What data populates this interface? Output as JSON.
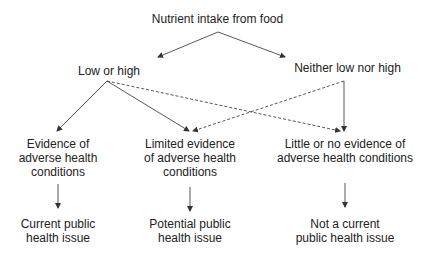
{
  "root": {
    "label": "Nutrient intake from food"
  },
  "level1": [
    {
      "label": "Low or high"
    },
    {
      "label": "Neither low nor high"
    }
  ],
  "level2": [
    {
      "lines": [
        "Evidence of",
        "adverse health",
        "conditions"
      ]
    },
    {
      "lines": [
        "Limited evidence",
        "of adverse health",
        "conditions"
      ]
    },
    {
      "lines": [
        "Little or no evidence of",
        "adverse health conditions"
      ]
    }
  ],
  "level3": [
    {
      "lines": [
        "Current public",
        "health issue"
      ]
    },
    {
      "lines": [
        "Potential public",
        "health issue"
      ]
    },
    {
      "lines": [
        "Not a current",
        "public health issue"
      ]
    }
  ],
  "edges": {
    "solid": [
      {
        "from": "Nutrient intake from food",
        "to": "Low or high"
      },
      {
        "from": "Nutrient intake from food",
        "to": "Neither low nor high"
      },
      {
        "from": "Low or high",
        "to": "Evidence of adverse health conditions"
      },
      {
        "from": "Low or high",
        "to": "Limited evidence of adverse health conditions"
      },
      {
        "from": "Neither low nor high",
        "to": "Little or no evidence of adverse health conditions"
      },
      {
        "from": "Evidence of adverse health conditions",
        "to": "Current public health issue"
      },
      {
        "from": "Limited evidence of adverse health conditions",
        "to": "Potential public health issue"
      },
      {
        "from": "Little or no evidence of adverse health conditions",
        "to": "Not a current public health issue"
      }
    ],
    "dashed": [
      {
        "from": "Low or high",
        "to": "Little or no evidence of adverse health conditions"
      },
      {
        "from": "Neither low nor high",
        "to": "Limited evidence of adverse health conditions"
      }
    ]
  },
  "colors": {
    "line": "#333333",
    "text": "#222222"
  }
}
